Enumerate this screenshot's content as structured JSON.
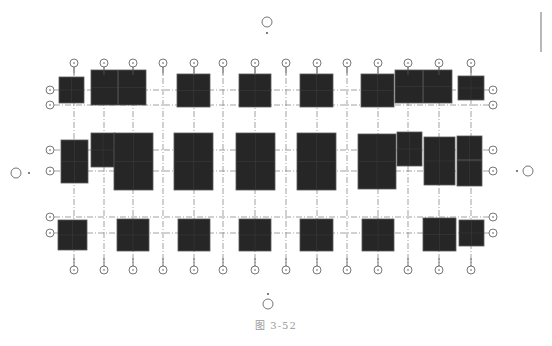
{
  "figure": {
    "caption": "图 3-52",
    "type": "structural foundation plan (axis grid with column footings)"
  },
  "colors": {
    "block_fill": "#262626",
    "block_edge": "#5a5a5a",
    "grid_line": "#8a8a8a",
    "bubble_stroke": "#555555",
    "caption": "#9a9a9a"
  },
  "grid": {
    "columns_x": [
      74,
      104,
      133,
      163,
      194,
      223,
      255,
      286,
      317,
      347,
      378,
      408,
      439,
      471
    ],
    "rows_y": [
      90,
      105,
      150,
      171,
      217,
      233
    ],
    "top_bubble_y": 63,
    "bottom_bubble_y": 270,
    "left_bubble_x": 50,
    "right_bubble_x": 493,
    "bubble_radius": 4
  },
  "view_markers": [
    {
      "name": "top",
      "x": 267,
      "y": 22,
      "dot_x": 267,
      "dot_y": 33
    },
    {
      "name": "bottom",
      "x": 268,
      "y": 304,
      "dot_x": 268,
      "dot_y": 294
    },
    {
      "name": "left",
      "x": 16,
      "y": 173,
      "dot_x": 29,
      "dot_y": 173
    },
    {
      "name": "right",
      "x": 528,
      "y": 171,
      "dot_x": 517,
      "dot_y": 171
    }
  ],
  "footings": [
    {
      "row": "top",
      "x": 59,
      "y": 77,
      "w": 25,
      "h": 26
    },
    {
      "row": "top",
      "x": 91,
      "y": 70,
      "w": 55,
      "h": 35,
      "divider_x": 118
    },
    {
      "row": "top",
      "x": 177,
      "y": 74,
      "w": 33,
      "h": 33
    },
    {
      "row": "top",
      "x": 239,
      "y": 74,
      "w": 32,
      "h": 33
    },
    {
      "row": "top",
      "x": 300,
      "y": 74,
      "w": 33,
      "h": 33
    },
    {
      "row": "top",
      "x": 361,
      "y": 74,
      "w": 33,
      "h": 33
    },
    {
      "row": "top",
      "x": 395,
      "y": 70,
      "w": 57,
      "h": 33,
      "divider_x": 423
    },
    {
      "row": "top",
      "x": 458,
      "y": 76,
      "w": 26,
      "h": 24
    },
    {
      "row": "middle",
      "x": 61,
      "y": 140,
      "w": 27,
      "h": 43
    },
    {
      "row": "middle",
      "x": 91,
      "y": 133,
      "w": 24,
      "h": 34
    },
    {
      "row": "middle",
      "x": 114,
      "y": 133,
      "w": 39,
      "h": 57
    },
    {
      "row": "middle",
      "x": 174,
      "y": 133,
      "w": 39,
      "h": 57
    },
    {
      "row": "middle",
      "x": 236,
      "y": 133,
      "w": 39,
      "h": 57
    },
    {
      "row": "middle",
      "x": 297,
      "y": 133,
      "w": 39,
      "h": 57
    },
    {
      "row": "middle",
      "x": 358,
      "y": 134,
      "w": 38,
      "h": 55
    },
    {
      "row": "middle",
      "x": 397,
      "y": 132,
      "w": 25,
      "h": 34
    },
    {
      "row": "middle",
      "x": 424,
      "y": 137,
      "w": 31,
      "h": 48
    },
    {
      "row": "middle",
      "x": 457,
      "y": 136,
      "w": 25,
      "h": 50,
      "divider_y": 160
    },
    {
      "row": "bottom",
      "x": 58,
      "y": 220,
      "w": 29,
      "h": 30
    },
    {
      "row": "bottom",
      "x": 117,
      "y": 219,
      "w": 32,
      "h": 32
    },
    {
      "row": "bottom",
      "x": 178,
      "y": 219,
      "w": 32,
      "h": 32
    },
    {
      "row": "bottom",
      "x": 239,
      "y": 219,
      "w": 32,
      "h": 32
    },
    {
      "row": "bottom",
      "x": 300,
      "y": 219,
      "w": 33,
      "h": 32
    },
    {
      "row": "bottom",
      "x": 362,
      "y": 219,
      "w": 32,
      "h": 32
    },
    {
      "row": "bottom",
      "x": 423,
      "y": 218,
      "w": 33,
      "h": 33
    },
    {
      "row": "bottom",
      "x": 459,
      "y": 220,
      "w": 25,
      "h": 26
    }
  ]
}
